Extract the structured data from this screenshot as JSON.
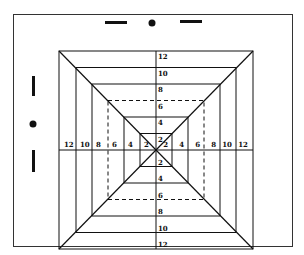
{
  "diagram": {
    "type": "concentric-square-grid",
    "frame": {
      "x": 13,
      "y": 14,
      "w": 279,
      "h": 232,
      "color": "#333333"
    },
    "center": {
      "x": 156,
      "y": 150
    },
    "ring_labels": [
      "2",
      "4",
      "6",
      "8",
      "10",
      "12"
    ],
    "ring_step_x": 16,
    "ring_step_y": 16.5,
    "dashed_ring": "6",
    "line_color": "#111111",
    "markers": {
      "top": [
        "dash",
        "dot",
        "dash"
      ],
      "left": [
        "dash",
        "dot",
        "dash"
      ]
    }
  }
}
